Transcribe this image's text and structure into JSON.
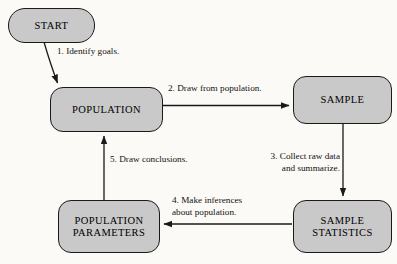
{
  "diagram": {
    "background_color": "#fbfaf7",
    "node_fill_color": "#c9c9c9",
    "node_border_color": "#1a1a1a",
    "arrow_color": "#1a1a1a",
    "nodes": [
      {
        "id": "start",
        "label": "START",
        "shape": "pill",
        "font_size": 10.5
      },
      {
        "id": "population",
        "label": "POPULATION",
        "shape": "rounded-rect",
        "font_size": 10.5
      },
      {
        "id": "sample",
        "label": "SAMPLE",
        "shape": "rounded-rect",
        "font_size": 10.5
      },
      {
        "id": "sample-statistics",
        "label": "SAMPLE\nSTATISTICS",
        "shape": "rounded-rect",
        "font_size": 10.5
      },
      {
        "id": "population-parameters",
        "label": "POPULATION\nPARAMETERS",
        "shape": "rounded-rect",
        "font_size": 10.5
      }
    ],
    "edges": [
      {
        "id": "edge-1",
        "number": "1",
        "label": "1. Identify goals.",
        "from": "start",
        "to": "population"
      },
      {
        "id": "edge-2",
        "number": "2",
        "label": "2. Draw from population.",
        "from": "population",
        "to": "sample"
      },
      {
        "id": "edge-3",
        "number": "3",
        "label": "3. Collect raw data\nand summarize.",
        "from": "sample",
        "to": "sample-statistics"
      },
      {
        "id": "edge-4",
        "number": "4",
        "label": "4. Make inferences\nabout population.",
        "from": "sample-statistics",
        "to": "population-parameters"
      },
      {
        "id": "edge-5",
        "number": "5",
        "label": "5. Draw conclusions.",
        "from": "population-parameters",
        "to": "population"
      }
    ]
  }
}
